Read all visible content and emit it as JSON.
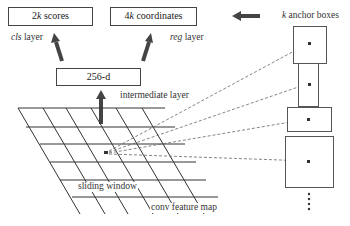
{
  "diagram": {
    "boxes": {
      "cls_output": {
        "prefix": "2",
        "var": "k",
        "suffix": " scores"
      },
      "reg_output": {
        "prefix": "4",
        "var": "k",
        "suffix": " coordinates"
      },
      "intermediate": {
        "label": "256-d"
      }
    },
    "labels": {
      "cls_layer": {
        "italic": "cls",
        "rest": " layer"
      },
      "reg_layer": {
        "italic": "reg",
        "rest": " layer"
      },
      "intermediate_layer": "intermediate layer",
      "anchor_boxes": {
        "italic": "k",
        "rest": " anchor boxes"
      },
      "sliding_window": "sliding window",
      "feature_map": "conv feature map"
    },
    "anchors": [
      {
        "x": 293,
        "y": 26,
        "w": 33,
        "h": 37
      },
      {
        "x": 298,
        "y": 63,
        "w": 20,
        "h": 43
      },
      {
        "x": 287,
        "y": 107,
        "w": 44,
        "h": 24
      },
      {
        "x": 285,
        "y": 136,
        "w": 48,
        "h": 51
      }
    ],
    "colors": {
      "stroke": "#333333",
      "arrow": "#444444",
      "dashed": "#555555"
    }
  }
}
